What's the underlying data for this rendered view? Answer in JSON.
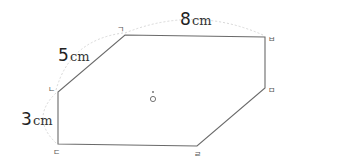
{
  "diagram": {
    "shape": "hexagon",
    "vertices": [
      {
        "label": "ㄱ",
        "x": 125,
        "y": 35
      },
      {
        "label": "ㅂ",
        "x": 265,
        "y": 37
      },
      {
        "label": "ㅁ",
        "x": 265,
        "y": 88
      },
      {
        "label": "ㄹ",
        "x": 197,
        "y": 146
      },
      {
        "label": "ㄷ",
        "x": 58,
        "y": 144
      },
      {
        "label": "ㄴ",
        "x": 58,
        "y": 92
      }
    ],
    "center": {
      "label": "ㅇ",
      "x": 153,
      "y": 99
    },
    "measurements": [
      {
        "number": "8",
        "unit": "cm",
        "edge": "ㄱㅂ"
      },
      {
        "number": "5",
        "unit": "cm",
        "edge": "ㄴㄱ"
      },
      {
        "number": "3",
        "unit": "cm",
        "edge": "ㄴㄷ"
      }
    ]
  }
}
